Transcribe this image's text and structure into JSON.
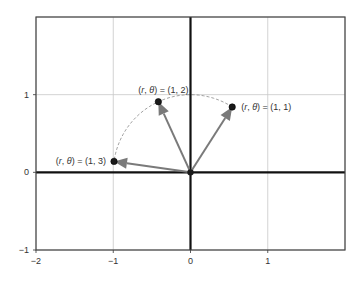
{
  "chart_data": {
    "type": "scatter",
    "title": "",
    "xlabel": "",
    "ylabel": "",
    "xlim": [
      -2,
      2
    ],
    "ylim": [
      -1,
      2
    ],
    "x_ticks": [
      -2,
      -1,
      0,
      1
    ],
    "y_ticks": [
      -1,
      0,
      1
    ],
    "x_tick_labels": [
      "−2",
      "−1",
      "0",
      "1"
    ],
    "y_tick_labels": [
      "−1",
      "0",
      "1"
    ],
    "grid": true,
    "origin": [
      0,
      0
    ],
    "unit_circle_arc": {
      "r": 1,
      "theta_start": 1,
      "theta_end": 3,
      "style": "dashed"
    },
    "points": [
      {
        "r": 1,
        "theta": 1,
        "x": 0.54,
        "y": 0.841,
        "label": "(r, θ) = (1, 1)",
        "label_side": "right"
      },
      {
        "r": 1,
        "theta": 2,
        "x": -0.416,
        "y": 0.909,
        "label": "(r, θ) = (1, 2)",
        "label_side": "above"
      },
      {
        "r": 1,
        "theta": 3,
        "x": -0.99,
        "y": 0.141,
        "label": "(r, θ) = (1, 3)",
        "label_side": "left"
      }
    ],
    "colors": {
      "arrow": "#7a7a7a",
      "point": "#1a1a1a",
      "axis": "#111111",
      "grid": "#c8c8c8",
      "arc": "#888888"
    }
  }
}
